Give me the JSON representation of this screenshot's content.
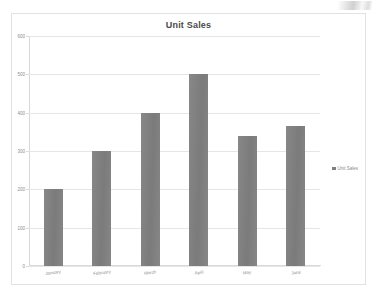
{
  "chart_data": {
    "type": "bar",
    "title": "Unit Sales",
    "xlabel": "",
    "ylabel": "",
    "categories": [
      "January",
      "February",
      "March",
      "April",
      "May",
      "June"
    ],
    "values": [
      200,
      300,
      400,
      500,
      340,
      365
    ],
    "series": [
      {
        "name": "Unit Sales",
        "values": [
          200,
          300,
          400,
          500,
          340,
          365
        ]
      }
    ],
    "ylim": [
      0,
      600
    ],
    "yticks": [
      0,
      100,
      200,
      300,
      400,
      500,
      600
    ],
    "ytick_labels": [
      "0",
      "100",
      "200",
      "300",
      "400",
      "500",
      "600"
    ],
    "grid": true,
    "legend_position": "right",
    "bar_color": "#808080"
  },
  "legend": {
    "entries": [
      {
        "label": "Unit Sales",
        "color": "#808080",
        "marker": "legend-square-marker"
      }
    ]
  }
}
